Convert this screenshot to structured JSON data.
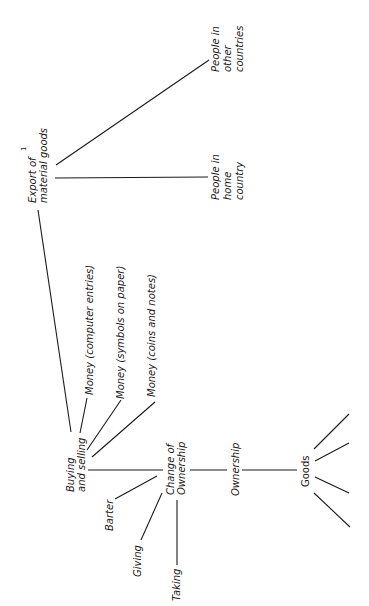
{
  "diagram": {
    "orientation": "rotated-90-ccw",
    "nodes": {
      "export": {
        "line1": "Export of",
        "line2": "material goods",
        "marker": "1"
      },
      "people_home": {
        "line1": "People in",
        "line2": "home",
        "line3": "country"
      },
      "people_other": {
        "line1": "People in",
        "line2": "other",
        "line3": "countries"
      },
      "money_computer": {
        "label": "Money (computer entries)"
      },
      "money_symbols": {
        "label": "Money (symbols on paper)"
      },
      "money_coins": {
        "label": "Money (coins and notes)"
      },
      "buying_selling": {
        "line1": "Buying",
        "line2": "and selling"
      },
      "change_ownership": {
        "line1": "Change of",
        "line2": "Ownership"
      },
      "ownership": {
        "label": "Ownership"
      },
      "goods": {
        "label": "Goods"
      },
      "barter": {
        "label": "Barter"
      },
      "giving": {
        "label": "Giving"
      },
      "taking": {
        "label": "Taking"
      }
    },
    "edges": [
      [
        "export",
        "people_home"
      ],
      [
        "export",
        "people_other"
      ],
      [
        "export",
        "buying_selling"
      ],
      [
        "money_computer",
        "buying_selling"
      ],
      [
        "money_symbols",
        "buying_selling"
      ],
      [
        "money_coins",
        "buying_selling"
      ],
      [
        "buying_selling",
        "change_ownership"
      ],
      [
        "barter",
        "change_ownership"
      ],
      [
        "giving",
        "change_ownership"
      ],
      [
        "taking",
        "change_ownership"
      ],
      [
        "change_ownership",
        "ownership"
      ],
      [
        "ownership",
        "goods"
      ],
      [
        "goods",
        "branch-1"
      ],
      [
        "goods",
        "branch-2"
      ],
      [
        "goods",
        "branch-3"
      ],
      [
        "goods",
        "branch-4"
      ]
    ],
    "colors": {
      "ink": "#1a1a1a",
      "background": "#ffffff"
    }
  }
}
